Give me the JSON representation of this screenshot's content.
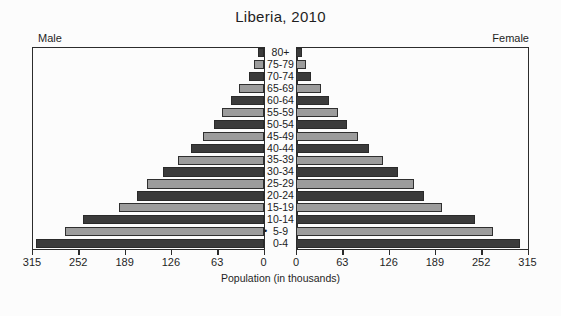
{
  "chart_data": {
    "type": "bar",
    "subtype": "population-pyramid",
    "title": "Liberia, 2010",
    "xlabel": "Population (in thousands)",
    "ylabel": "",
    "left_caption": "Male",
    "right_caption": "Female",
    "categories": [
      "80+",
      "75-79",
      "70-74",
      "65-69",
      "60-64",
      "55-59",
      "50-54",
      "45-49",
      "40-44",
      "35-39",
      "30-34",
      "25-29",
      "20-24",
      "15-19",
      "10-14",
      "5-9",
      "0-4"
    ],
    "series": [
      {
        "name": "Male",
        "values": [
          7,
          13,
          20,
          33,
          44,
          56,
          68,
          82,
          98,
          117,
          137,
          158,
          172,
          196,
          245,
          270,
          310
        ]
      },
      {
        "name": "Female",
        "values": [
          8,
          14,
          21,
          34,
          45,
          57,
          70,
          84,
          100,
          119,
          139,
          160,
          174,
          198,
          243,
          268,
          305
        ]
      }
    ],
    "xlim": [
      0,
      315
    ],
    "ticks": [
      315,
      252,
      189,
      126,
      63,
      0
    ],
    "tick_labels_left": [
      "315",
      "252",
      "189",
      "126",
      "63",
      "0"
    ],
    "tick_labels_right": [
      "0",
      "63",
      "126",
      "189",
      "252",
      "315"
    ],
    "grid": false,
    "legend": "none",
    "bar_colors": {
      "dark": "#3b3b3b",
      "light": "#9c9c9c",
      "border": "#2f2f2f"
    },
    "background": "#fcfcfc",
    "annotations": [
      {
        "near": "5-9",
        "marker": "•"
      }
    ]
  }
}
